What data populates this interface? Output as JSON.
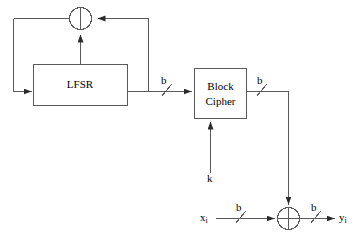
{
  "diagram": {
    "stroke_color": "#3f3f3f",
    "text_color": "#000000",
    "background": "#ffffff",
    "blocks": [
      {
        "id": "lfsr",
        "label": "LFSR"
      },
      {
        "id": "block-cipher",
        "label_line1": "Block",
        "label_line2": "Cipher"
      }
    ],
    "operators": [
      {
        "id": "xor-feedback",
        "symbol": "XOR"
      },
      {
        "id": "xor-output",
        "symbol": "XOR"
      }
    ],
    "labels": {
      "lfsr_out_width": "b",
      "cipher_out_width": "b",
      "key": "k",
      "plaintext": "x",
      "plaintext_sub": "i",
      "plaintext_width": "b",
      "ciphertext": "y",
      "ciphertext_sub": "i",
      "ciphertext_width": "b"
    }
  }
}
